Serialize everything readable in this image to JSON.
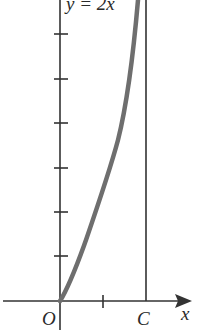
{
  "figure": {
    "curve_label": "y = 2x",
    "origin_label": "O",
    "point_label": "C",
    "x_axis_label": "x",
    "colors": {
      "axis": "#333333",
      "curve": "#6e6e6e",
      "background": "#ffffff"
    },
    "y_ticks_count": 6,
    "x_ticks_count": 1
  }
}
